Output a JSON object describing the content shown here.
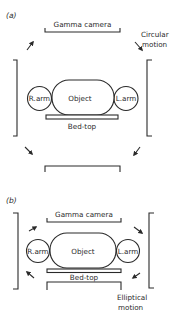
{
  "figure": {
    "panels": [
      {
        "id": "a",
        "label": "(a)",
        "camera_label": "Gamma camera",
        "object_label": "Object",
        "right_arm_label": "R.arm",
        "left_arm_label": "L.arm",
        "bed_label": "Bed-top",
        "motion_label_line1": "Circular",
        "motion_label_line2": "motion"
      },
      {
        "id": "b",
        "label": "(b)",
        "camera_label": "Gamma camera",
        "object_label": "Object",
        "right_arm_label": "R.arm",
        "left_arm_label": "L.arm",
        "bed_label": "Bed-top",
        "motion_label_line1": "Elliptical",
        "motion_label_line2": "motion"
      }
    ]
  },
  "colors": {
    "ink": "#2a2a2a",
    "background": "#ffffff"
  }
}
